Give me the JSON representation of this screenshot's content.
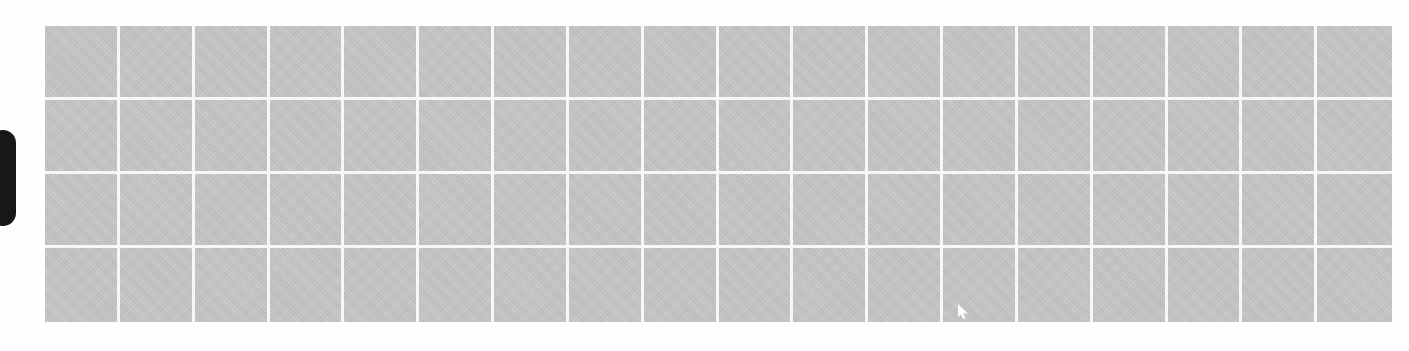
{
  "canvas": {
    "width": 1409,
    "height": 351,
    "background_color": "#fefefe",
    "description": "Blank grid placeholder panel with left edge drawer handle"
  },
  "drawer_handle": {
    "label": "",
    "color": "#171717",
    "x": 0,
    "y": 130,
    "width": 16,
    "height": 96,
    "icon": "drawer-handle-pill"
  },
  "grid_panel": {
    "label": "",
    "x": 45,
    "y": 26,
    "width": 1347,
    "height": 296,
    "cell_color": "#c3c3c3",
    "gridline_color": "#f7f7f7",
    "gridline_width": 3,
    "columns": 18,
    "rows": 4
  },
  "cursor": {
    "x": 962,
    "y": 312,
    "color": "#ffffff",
    "icon": "mouse-pointer-icon"
  }
}
